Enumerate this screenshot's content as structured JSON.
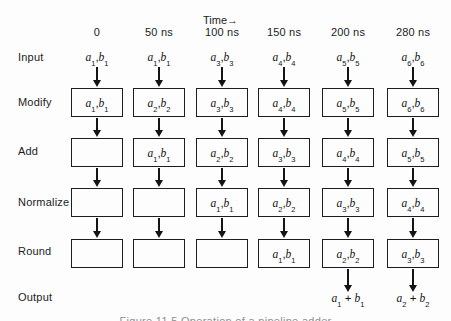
{
  "time_header": "Time→",
  "time_ticks": [
    "0",
    "50 ns",
    "100 ns",
    "150 ns",
    "200 ns",
    "280 ns"
  ],
  "row_labels": [
    "Input",
    "Modify",
    "Add",
    "Normalize",
    "Round",
    "Output"
  ],
  "input_row": [
    [
      1,
      1
    ],
    [
      1,
      1
    ],
    [
      3,
      3
    ],
    [
      4,
      4
    ],
    [
      5,
      5
    ],
    [
      6,
      6
    ]
  ],
  "stages": {
    "modify": [
      [
        1,
        1
      ],
      [
        2,
        2
      ],
      [
        3,
        3
      ],
      [
        4,
        4
      ],
      [
        5,
        5
      ],
      [
        6,
        6
      ]
    ],
    "add": [
      null,
      [
        1,
        1
      ],
      [
        2,
        2
      ],
      [
        3,
        3
      ],
      [
        4,
        4
      ],
      [
        5,
        5
      ]
    ],
    "normalize": [
      null,
      null,
      [
        1,
        1
      ],
      [
        2,
        2
      ],
      [
        3,
        3
      ],
      [
        4,
        4
      ]
    ],
    "round": [
      null,
      null,
      null,
      [
        1,
        1
      ],
      [
        2,
        2
      ],
      [
        3,
        3
      ]
    ]
  },
  "output_sums": [
    null,
    null,
    null,
    null,
    1,
    2
  ],
  "caption": "Figure 11.5 Operation of a pipeline adder",
  "colors": {
    "ink": "#141414",
    "background": "#fdfdfd"
  }
}
